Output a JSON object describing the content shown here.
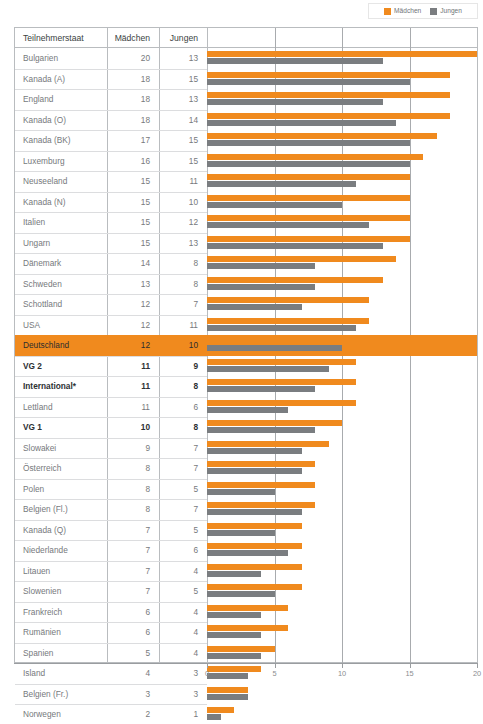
{
  "legend": {
    "items": [
      {
        "label": "Mädchen",
        "color": "#F08A1E",
        "icon": "legend-swatch-girls"
      },
      {
        "label": "Jungen",
        "color": "#7a7d80",
        "icon": "legend-swatch-boys"
      }
    ]
  },
  "table": {
    "headers": {
      "state": "Teilnehmerstaat",
      "girls": "Mädchen",
      "boys": "Jungen"
    }
  },
  "footnote": "",
  "chart_data": {
    "type": "bar",
    "orientation": "horizontal",
    "title": "",
    "xlabel": "",
    "ylabel": "",
    "xlim": [
      0,
      20
    ],
    "xticks": [
      0,
      5,
      10,
      15,
      20
    ],
    "xticklabels": [
      "0",
      "5",
      "10",
      "15",
      "20"
    ],
    "grid": true,
    "legend_position": "top-right",
    "categories": [
      "Bulgarien",
      "Kanada (A)",
      "England",
      "Kanada (O)",
      "Kanada (BK)",
      "Luxemburg",
      "Neuseeland",
      "Kanada (N)",
      "Italien",
      "Ungarn",
      "Dänemark",
      "Schweden",
      "Schottland",
      "USA",
      "Deutschland",
      "VG 2",
      "International*",
      "Lettland",
      "VG 1",
      "Slowakei",
      "Österreich",
      "Polen",
      "Belgien (Fl.)",
      "Kanada (Q)",
      "Niederlande",
      "Litauen",
      "Slowenien",
      "Frankreich",
      "Rumänien",
      "Spanien",
      "Island",
      "Belgien (Fr.)",
      "Norwegen"
    ],
    "series": [
      {
        "name": "Mädchen",
        "color": "#F08A1E",
        "values": [
          20,
          18,
          18,
          18,
          17,
          16,
          15,
          15,
          15,
          15,
          14,
          13,
          12,
          12,
          12,
          11,
          11,
          11,
          10,
          9,
          8,
          8,
          8,
          7,
          7,
          7,
          7,
          6,
          6,
          5,
          4,
          3,
          2
        ]
      },
      {
        "name": "Jungen",
        "color": "#7a7d80",
        "values": [
          13,
          15,
          13,
          14,
          15,
          15,
          11,
          10,
          12,
          13,
          8,
          8,
          7,
          11,
          10,
          9,
          8,
          6,
          8,
          7,
          7,
          5,
          7,
          5,
          6,
          4,
          5,
          4,
          4,
          4,
          3,
          3,
          1
        ]
      }
    ]
  },
  "rows": [
    {
      "state": "Bulgarien",
      "girls": 20,
      "boys": 13,
      "bold": false,
      "highlight": false
    },
    {
      "state": "Kanada (A)",
      "girls": 18,
      "boys": 15,
      "bold": false,
      "highlight": false
    },
    {
      "state": "England",
      "girls": 18,
      "boys": 13,
      "bold": false,
      "highlight": false
    },
    {
      "state": "Kanada (O)",
      "girls": 18,
      "boys": 14,
      "bold": false,
      "highlight": false
    },
    {
      "state": "Kanada (BK)",
      "girls": 17,
      "boys": 15,
      "bold": false,
      "highlight": false
    },
    {
      "state": "Luxemburg",
      "girls": 16,
      "boys": 15,
      "bold": false,
      "highlight": false
    },
    {
      "state": "Neuseeland",
      "girls": 15,
      "boys": 11,
      "bold": false,
      "highlight": false
    },
    {
      "state": "Kanada (N)",
      "girls": 15,
      "boys": 10,
      "bold": false,
      "highlight": false
    },
    {
      "state": "Italien",
      "girls": 15,
      "boys": 12,
      "bold": false,
      "highlight": false
    },
    {
      "state": "Ungarn",
      "girls": 15,
      "boys": 13,
      "bold": false,
      "highlight": false
    },
    {
      "state": "Dänemark",
      "girls": 14,
      "boys": 8,
      "bold": false,
      "highlight": false
    },
    {
      "state": "Schweden",
      "girls": 13,
      "boys": 8,
      "bold": false,
      "highlight": false
    },
    {
      "state": "Schottland",
      "girls": 12,
      "boys": 7,
      "bold": false,
      "highlight": false
    },
    {
      "state": "USA",
      "girls": 12,
      "boys": 11,
      "bold": false,
      "highlight": false
    },
    {
      "state": "Deutschland",
      "girls": 12,
      "boys": 10,
      "bold": false,
      "highlight": true
    },
    {
      "state": "VG 2",
      "girls": 11,
      "boys": 9,
      "bold": true,
      "highlight": false
    },
    {
      "state": "International*",
      "girls": 11,
      "boys": 8,
      "bold": true,
      "highlight": false
    },
    {
      "state": "Lettland",
      "girls": 11,
      "boys": 6,
      "bold": false,
      "highlight": false
    },
    {
      "state": "VG 1",
      "girls": 10,
      "boys": 8,
      "bold": true,
      "highlight": false
    },
    {
      "state": "Slowakei",
      "girls": 9,
      "boys": 7,
      "bold": false,
      "highlight": false
    },
    {
      "state": "Österreich",
      "girls": 8,
      "boys": 7,
      "bold": false,
      "highlight": false
    },
    {
      "state": "Polen",
      "girls": 8,
      "boys": 5,
      "bold": false,
      "highlight": false
    },
    {
      "state": "Belgien (Fl.)",
      "girls": 8,
      "boys": 7,
      "bold": false,
      "highlight": false
    },
    {
      "state": "Kanada (Q)",
      "girls": 7,
      "boys": 5,
      "bold": false,
      "highlight": false
    },
    {
      "state": "Niederlande",
      "girls": 7,
      "boys": 6,
      "bold": false,
      "highlight": false
    },
    {
      "state": "Litauen",
      "girls": 7,
      "boys": 4,
      "bold": false,
      "highlight": false
    },
    {
      "state": "Slowenien",
      "girls": 7,
      "boys": 5,
      "bold": false,
      "highlight": false
    },
    {
      "state": "Frankreich",
      "girls": 6,
      "boys": 4,
      "bold": false,
      "highlight": false
    },
    {
      "state": "Rumänien",
      "girls": 6,
      "boys": 4,
      "bold": false,
      "highlight": false
    },
    {
      "state": "Spanien",
      "girls": 5,
      "boys": 4,
      "bold": false,
      "highlight": false
    },
    {
      "state": "Island",
      "girls": 4,
      "boys": 3,
      "bold": false,
      "highlight": false
    },
    {
      "state": "Belgien (Fr.)",
      "girls": 3,
      "boys": 3,
      "bold": false,
      "highlight": false
    },
    {
      "state": "Norwegen",
      "girls": 2,
      "boys": 1,
      "bold": false,
      "highlight": false
    }
  ]
}
